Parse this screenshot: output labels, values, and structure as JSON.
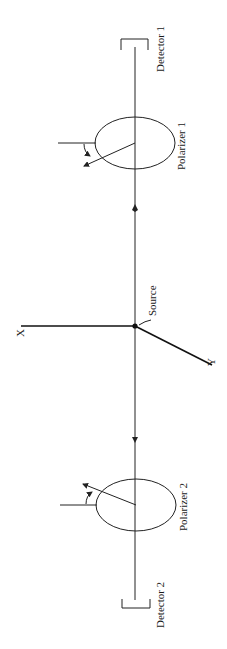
{
  "diagram": {
    "type": "polarization-correlation-experiment",
    "orientation": "rotated-90-degrees",
    "labels": {
      "detector_1": "Detector 1",
      "polarizer_1": "Polarizer 1",
      "source": "Source",
      "axis_x": "X",
      "axis_y": "Y",
      "polarizer_2": "Polarizer 2",
      "detector_2": "Detector 2"
    },
    "components": [
      {
        "id": "detector-1",
        "label_key": "detector_1"
      },
      {
        "id": "polarizer-1",
        "label_key": "polarizer_1"
      },
      {
        "id": "source",
        "label_key": "source"
      },
      {
        "id": "polarizer-2",
        "label_key": "polarizer_2"
      },
      {
        "id": "detector-2",
        "label_key": "detector_2"
      }
    ],
    "beams": [
      {
        "from": "source",
        "to": "polarizer-1",
        "arrow": "toward polarizer 1"
      },
      {
        "from": "source",
        "to": "polarizer-2",
        "arrow": "toward polarizer 2"
      }
    ],
    "colors": {
      "ink": "#1a1a1a",
      "background": "#ffffff"
    }
  }
}
